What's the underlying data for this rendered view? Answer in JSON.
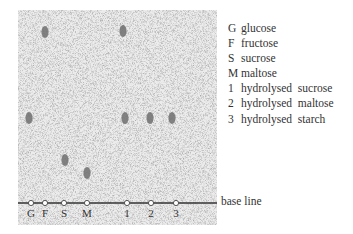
{
  "diagram": {
    "type": "paper-chromatogram",
    "colors": {
      "paper": "#e6e6e6",
      "spot": "#6e6e6e",
      "baseline": "#333333"
    },
    "baseline_label": "base line",
    "lanes": [
      {
        "key": "G",
        "x": 31
      },
      {
        "key": "F",
        "x": 45
      },
      {
        "key": "S",
        "x": 64
      },
      {
        "key": "M",
        "x": 87
      },
      {
        "key": "1",
        "x": 127
      },
      {
        "key": "2",
        "x": 151
      },
      {
        "key": "3",
        "x": 176
      }
    ],
    "spots": [
      {
        "lane": "F",
        "x": 45,
        "y": 32
      },
      {
        "lane": "1",
        "x": 123,
        "y": 31
      },
      {
        "lane": "G",
        "x": 29,
        "y": 118
      },
      {
        "lane": "1",
        "x": 125,
        "y": 118
      },
      {
        "lane": "2",
        "x": 150,
        "y": 118
      },
      {
        "lane": "3",
        "x": 172,
        "y": 118
      },
      {
        "lane": "S",
        "x": 65,
        "y": 160
      },
      {
        "lane": "M",
        "x": 87,
        "y": 173
      }
    ]
  },
  "legend": [
    {
      "key": "G",
      "label": "glucose"
    },
    {
      "key": "F",
      "label": "fructose"
    },
    {
      "key": "S",
      "label": "sucrose"
    },
    {
      "key": "M",
      "label": "maltose"
    },
    {
      "key": "1",
      "label": "hydrolysed  sucrose"
    },
    {
      "key": "2",
      "label": "hydrolysed  maltose"
    },
    {
      "key": "3",
      "label": "hydrolysed  starch"
    }
  ]
}
